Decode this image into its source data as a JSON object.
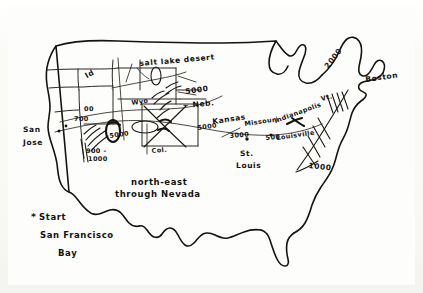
{
  "document": {
    "kind": "hand-drawn-map-sketch",
    "subject": "United States route sketch",
    "medium": "ink on paper"
  },
  "labels": {
    "salt_lake_desert": "salt lake desert",
    "idaho": "Id",
    "wyoming": "Wyo",
    "nebraska": "~ Neb.",
    "colorado": "Col.",
    "kansas": "Kansas",
    "missouri": "Missouri",
    "indianapolis": "Indianapolis",
    "louisville": "Louisville",
    "st_louis_line1": "St.",
    "st_louis_line2": "Louis",
    "boston": "Boston",
    "vermont": "Vt.",
    "san_jose_line1": "San",
    "san_jose_line2": "Jose"
  },
  "elevations": {
    "salt_lake_5000": "5000",
    "nebraska_5000": "5000",
    "kansas_5000": "5000",
    "missouri_3000": "3000",
    "indiana_500": "500",
    "sierra_700": "700",
    "sierra_00": "00",
    "sierra_900": "900 -",
    "sierra_1000": "1000",
    "nevada_5000": "5000",
    "appalachian_2000": "2000",
    "appalachian_1000": "1000"
  },
  "route_note": {
    "line1": "north-east",
    "line2": "through Nevada"
  },
  "start_legend": {
    "marker": "*",
    "line1": "Start",
    "line2": "San Francisco",
    "line3": "Bay"
  },
  "colors": {
    "ink": "#15130f",
    "paper": "#fbfbf9",
    "state_line": "#2a2721"
  }
}
